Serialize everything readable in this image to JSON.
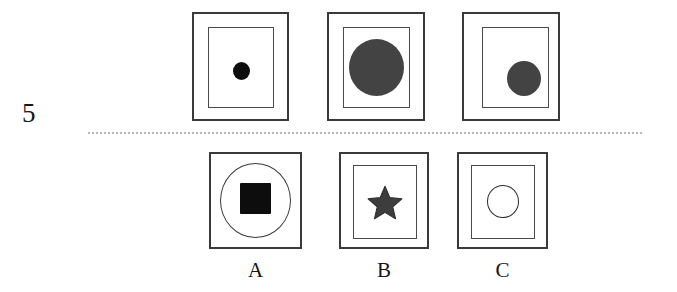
{
  "item": {
    "number": "5",
    "type": "matrix-reasoning-multiple-choice"
  },
  "colors": {
    "stroke_outer": "#3a3a3a",
    "stroke_inner": "#4a4a4a",
    "black_fill": "#0d0d0d",
    "dark_gray_fill": "#434343",
    "star_fill": "#3d3d3d",
    "separator": "#b9b9b9",
    "background": "#ffffff",
    "text": "#171717"
  },
  "separator": {
    "style": "dotted",
    "label": "dotted-divider"
  },
  "stimulus_row": {
    "label": "stimulus-sequence",
    "panels": [
      {
        "id": "stimulus-1",
        "position": 1,
        "frame": "double-rectangle",
        "shape": "circle",
        "shape_fill": "solid",
        "shape_color": "#0d0d0d",
        "shape_size": "small",
        "shape_position": "center"
      },
      {
        "id": "stimulus-2",
        "position": 2,
        "frame": "double-rectangle",
        "shape": "circle",
        "shape_fill": "solid",
        "shape_color": "#434343",
        "shape_size": "large",
        "shape_position": "center"
      },
      {
        "id": "stimulus-3",
        "position": 3,
        "frame": "double-rectangle",
        "shape": "circle",
        "shape_fill": "solid",
        "shape_color": "#434343",
        "shape_size": "medium",
        "shape_position": "lower-right"
      }
    ]
  },
  "options_row": {
    "label": "answer-options",
    "options": [
      {
        "id": "option-a",
        "label": "A",
        "frame": "rectangle-with-circle",
        "shape": "square",
        "shape_fill": "solid",
        "shape_color": "#0d0d0d",
        "shape_size": "medium",
        "shape_position": "center"
      },
      {
        "id": "option-b",
        "label": "B",
        "frame": "double-rectangle",
        "shape": "star",
        "shape_fill": "solid",
        "shape_color": "#3d3d3d",
        "shape_size": "small",
        "shape_position": "center"
      },
      {
        "id": "option-c",
        "label": "C",
        "frame": "double-rectangle",
        "shape": "circle",
        "shape_fill": "outline",
        "shape_color": "#2c2c2c",
        "shape_size": "small",
        "shape_position": "center"
      }
    ]
  }
}
